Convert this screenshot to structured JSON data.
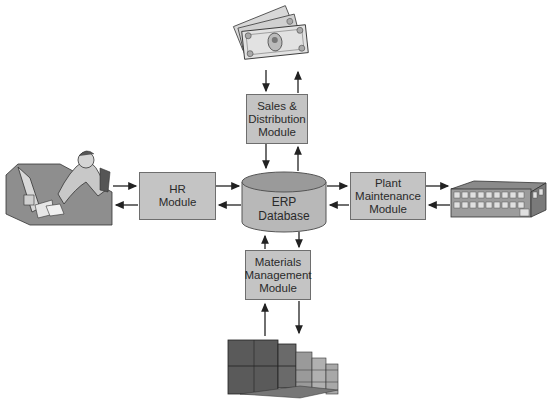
{
  "diagram": {
    "center": {
      "label": "ERP\nDatabase",
      "shape": "cylinder"
    },
    "modules": [
      {
        "id": "sales",
        "label": "Sales &\nDistribution\nModule",
        "position": "top",
        "external_entity": "money-icon"
      },
      {
        "id": "hr",
        "label": "HR\nModule",
        "position": "left",
        "external_entity": "office-worker-icon"
      },
      {
        "id": "plant",
        "label": "Plant\nMaintenance\nModule",
        "position": "right",
        "external_entity": "factory-building-icon"
      },
      {
        "id": "materials",
        "label": "Materials\nManagement\nModule",
        "position": "bottom",
        "external_entity": "inventory-boxes-icon"
      }
    ],
    "connections": "bidirectional arrows between each external entity and its module, and between each module and the ERP Database",
    "colors": {
      "module_fill": "#c4c4c4",
      "module_border": "#6e6e6e",
      "db_side": "#b8b8b8",
      "db_top": "#9a9a9a",
      "arrow": "#222222"
    }
  }
}
